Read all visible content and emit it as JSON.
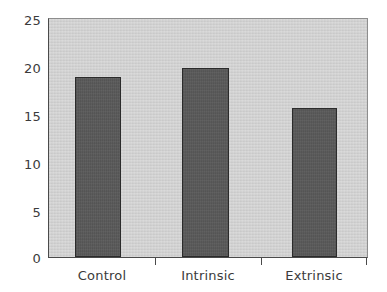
{
  "chart_data": {
    "type": "bar",
    "title": "",
    "subtitle": "",
    "xlabel": "",
    "ylabel": "",
    "categories": [
      "Control",
      "Intrinsic",
      "Extrinsic"
    ],
    "values": [
      18.9,
      19.9,
      15.7
    ],
    "series": [
      {
        "name": "",
        "values": [
          18.9,
          19.9,
          15.7
        ]
      }
    ],
    "ylim": [
      0,
      25
    ],
    "xlim": [
      0,
      3
    ],
    "y_ticks": [
      0,
      5,
      10,
      15,
      20,
      25
    ],
    "y_tick_labels": [
      "0",
      "5",
      "10",
      "15",
      "20",
      "25"
    ],
    "x_tick_labels": [
      "Control",
      "Intrinsic",
      "Extrinsic"
    ],
    "grid": false,
    "legend": false,
    "legend_position": "none",
    "annotations": [],
    "colors": {
      "bar_fill": "#575757",
      "bar_edge": "#2b2b2b",
      "plot_background": "#cbcbcb",
      "figure_background": "#ffffff",
      "axis": "#4a4a4a",
      "tick_text": "#3b3b3b"
    }
  }
}
